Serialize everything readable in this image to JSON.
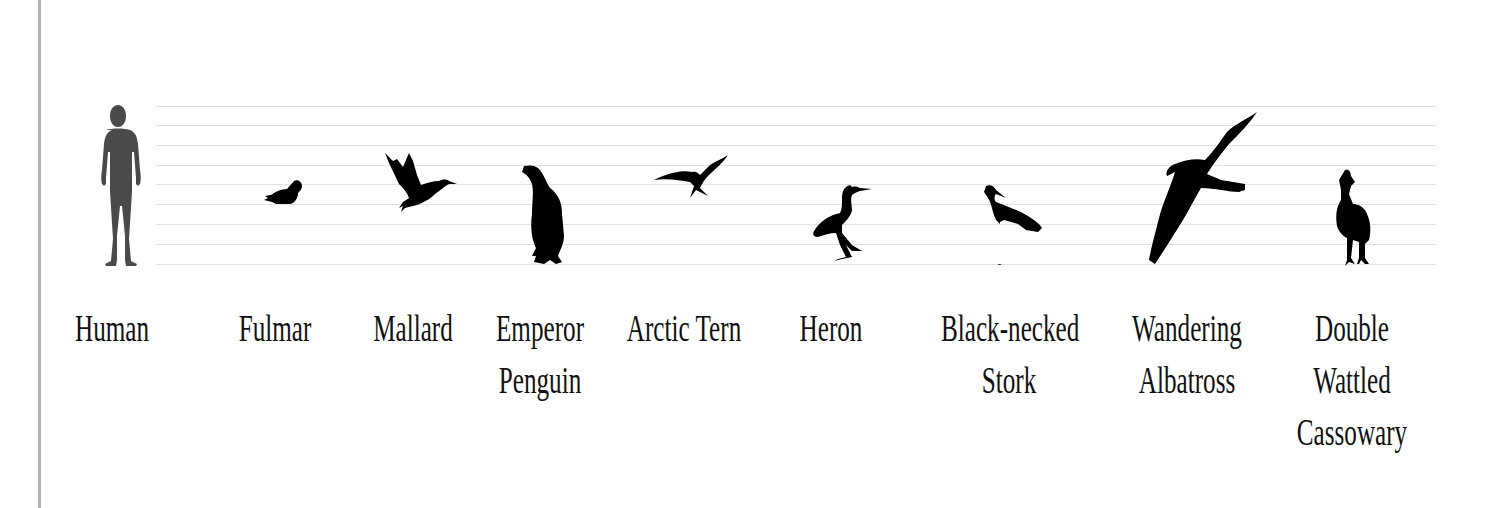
{
  "figure": {
    "type": "size-comparison",
    "grid_lines_y": [
      106,
      125,
      145,
      165,
      184,
      204,
      224,
      244,
      264
    ],
    "colors": {
      "human": "#4a4a4a",
      "bird": "#000000",
      "grid": "#e2e2e2",
      "border": "#b4b4b4",
      "text": "#111111"
    },
    "items": [
      {
        "id": "human",
        "icon": "human-silhouette",
        "label_lines": [
          "Human"
        ],
        "label_x": 112
      },
      {
        "id": "fulmar",
        "icon": "fulmar-silhouette",
        "label_lines": [
          "Fulmar"
        ],
        "label_x": 275
      },
      {
        "id": "mallard",
        "icon": "mallard-silhouette",
        "label_lines": [
          "Mallard"
        ],
        "label_x": 413
      },
      {
        "id": "penguin",
        "icon": "penguin-silhouette",
        "label_lines": [
          "Emperor",
          "Penguin"
        ],
        "label_x": 540
      },
      {
        "id": "tern",
        "icon": "tern-silhouette",
        "label_lines": [
          "Arctic Tern"
        ],
        "label_x": 684
      },
      {
        "id": "heron",
        "icon": "heron-silhouette",
        "label_lines": [
          "Heron"
        ],
        "label_x": 831
      },
      {
        "id": "stork",
        "icon": "stork-silhouette",
        "label_lines": [
          "Black-necked",
          "Stork"
        ],
        "label_x": 1009
      },
      {
        "id": "albatross",
        "icon": "albatross-silhouette",
        "label_lines": [
          "Wandering",
          "Albatross"
        ],
        "label_x": 1187
      },
      {
        "id": "cassowary",
        "icon": "cassowary-silhouette",
        "label_lines": [
          "Double",
          "Wattled",
          "Cassowary"
        ],
        "label_x": 1352
      }
    ]
  }
}
